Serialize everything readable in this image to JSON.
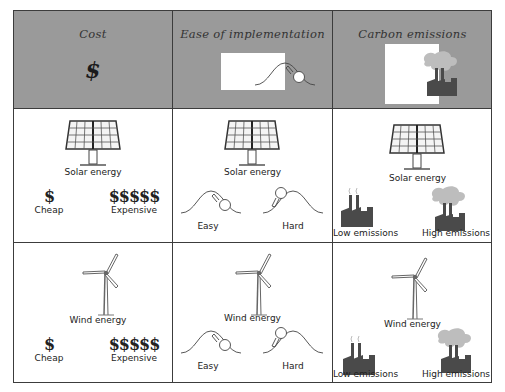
{
  "header": {
    "columns": [
      {
        "title": "Cost",
        "icon": "dollar-sign-icon",
        "symbol": "$"
      },
      {
        "title": "Ease of implementation",
        "icon": "boulder-uphill-icon"
      },
      {
        "title": "Carbon emissions",
        "icon": "factory-smoke-icon"
      }
    ]
  },
  "rows": [
    {
      "energy": "Solar energy",
      "energy_icon": "solar-panel-icon",
      "cost": {
        "low_symbol": "$",
        "low_label": "Cheap",
        "high_symbol": "$$$$$",
        "high_label": "Expensive"
      },
      "ease": {
        "low_label": "Easy",
        "high_label": "Hard"
      },
      "emissions": {
        "low_label": "Low emissions",
        "high_label": "High emissions"
      }
    },
    {
      "energy": "Wind energy",
      "energy_icon": "wind-turbine-icon",
      "cost": {
        "low_symbol": "$",
        "low_label": "Cheap",
        "high_symbol": "$$$$$",
        "high_label": "Expensive"
      },
      "ease": {
        "low_label": "Easy",
        "high_label": "Hard"
      },
      "emissions": {
        "low_label": "Low emissions",
        "high_label": "High emissions"
      }
    }
  ],
  "colors": {
    "header_bg": "#9a9a9a",
    "border": "#3c3c3c",
    "factory": "#4a4a4a",
    "smoke": "#bdbdbd"
  }
}
